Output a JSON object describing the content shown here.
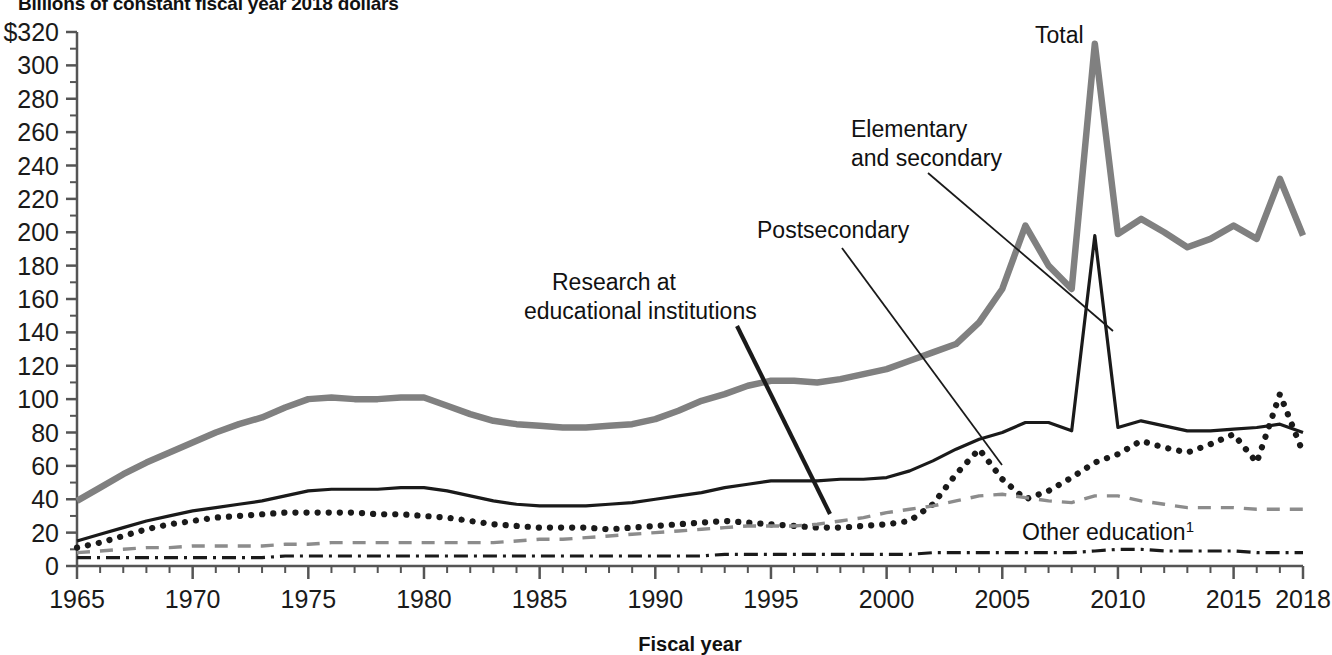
{
  "figure": {
    "title": "Billions of constant fiscal year 2018 dollars",
    "xlabel": "Fiscal year",
    "ylabel": ""
  },
  "annotations": {
    "total": "Total",
    "elementary_line1": "Elementary",
    "elementary_line2": "and secondary",
    "postsecondary": "Postsecondary",
    "research_line1": "Research at",
    "research_line2": "educational institutions",
    "other_education": "Other education",
    "other_education_footnote": "1"
  },
  "axes": {
    "y_ticks": [
      "$320",
      "300",
      "280",
      "260",
      "240",
      "220",
      "200",
      "180",
      "160",
      "140",
      "120",
      "100",
      "80",
      "60",
      "40",
      "20",
      "0"
    ],
    "y_tick_values": [
      320,
      300,
      280,
      260,
      240,
      220,
      200,
      180,
      160,
      140,
      120,
      100,
      80,
      60,
      40,
      20,
      0
    ],
    "x_ticks": [
      "1965",
      "1970",
      "1975",
      "1980",
      "1985",
      "1990",
      "1995",
      "2000",
      "2005",
      "2010",
      "2015",
      "2018"
    ],
    "x_tick_values": [
      1965,
      1970,
      1975,
      1980,
      1985,
      1990,
      1995,
      2000,
      2005,
      2010,
      2015,
      2018
    ]
  },
  "colors": {
    "total": "#808080",
    "elementary": "#1a1a1a",
    "postsecondary": "#1a1a1a",
    "research": "#8c8c8c",
    "other": "#1a1a1a",
    "axis": "#555555",
    "text": "#111111"
  },
  "chart_data": {
    "type": "line",
    "title": "Billions of constant fiscal year 2018 dollars",
    "xlabel": "Fiscal year",
    "ylabel": "Billions of constant fiscal year 2018 dollars",
    "xlim": [
      1965,
      2018
    ],
    "ylim": [
      0,
      320
    ],
    "grid": false,
    "legend": "annotated-inline",
    "x": [
      1965,
      1966,
      1967,
      1968,
      1969,
      1970,
      1971,
      1972,
      1973,
      1974,
      1975,
      1976,
      1977,
      1978,
      1979,
      1980,
      1981,
      1982,
      1983,
      1984,
      1985,
      1986,
      1987,
      1988,
      1989,
      1990,
      1991,
      1992,
      1993,
      1994,
      1995,
      1996,
      1997,
      1998,
      1999,
      2000,
      2001,
      2002,
      2003,
      2004,
      2005,
      2006,
      2007,
      2008,
      2009,
      2010,
      2011,
      2012,
      2013,
      2014,
      2015,
      2016,
      2017,
      2018
    ],
    "series": [
      {
        "name": "Total",
        "style": "solid-thick",
        "color": "#808080",
        "values": [
          39,
          47,
          55,
          62,
          68,
          74,
          80,
          85,
          89,
          95,
          100,
          101,
          100,
          100,
          101,
          101,
          96,
          91,
          87,
          85,
          84,
          83,
          83,
          84,
          85,
          88,
          93,
          99,
          103,
          108,
          111,
          111,
          110,
          112,
          115,
          118,
          123,
          128,
          133,
          146,
          166,
          204,
          180,
          166,
          313,
          199,
          208,
          200,
          191,
          196,
          204,
          196,
          232,
          198
        ]
      },
      {
        "name": "Elementary and secondary",
        "style": "solid-thin",
        "color": "#1a1a1a",
        "values": [
          15,
          19,
          23,
          27,
          30,
          33,
          35,
          37,
          39,
          42,
          45,
          46,
          46,
          46,
          47,
          47,
          45,
          42,
          39,
          37,
          36,
          36,
          36,
          37,
          38,
          40,
          42,
          44,
          47,
          49,
          51,
          51,
          51,
          52,
          52,
          53,
          57,
          63,
          70,
          76,
          80,
          86,
          86,
          81,
          198,
          83,
          87,
          84,
          81,
          81,
          82,
          83,
          85,
          80
        ]
      },
      {
        "name": "Postsecondary",
        "style": "dotted",
        "color": "#1a1a1a",
        "values": [
          11,
          14,
          18,
          22,
          25,
          27,
          29,
          30,
          31,
          32,
          32,
          32,
          32,
          31,
          31,
          30,
          29,
          27,
          25,
          24,
          23,
          23,
          23,
          22,
          23,
          24,
          25,
          26,
          27,
          26,
          25,
          24,
          23,
          23,
          24,
          25,
          27,
          37,
          55,
          70,
          52,
          40,
          45,
          53,
          62,
          67,
          75,
          71,
          68,
          73,
          79,
          62,
          103,
          68
        ]
      },
      {
        "name": "Research at educational institutions",
        "style": "dashed",
        "color": "#8c8c8c",
        "values": [
          8,
          9,
          10,
          11,
          11,
          12,
          12,
          12,
          12,
          13,
          13,
          14,
          14,
          14,
          14,
          14,
          14,
          14,
          14,
          15,
          16,
          16,
          17,
          18,
          19,
          20,
          21,
          22,
          23,
          24,
          24,
          24,
          25,
          27,
          29,
          32,
          34,
          36,
          39,
          42,
          43,
          41,
          39,
          38,
          42,
          42,
          39,
          37,
          35,
          35,
          35,
          34,
          34,
          34
        ]
      },
      {
        "name": "Other education",
        "style": "dash-dot",
        "color": "#1a1a1a",
        "values": [
          5,
          5,
          5,
          5,
          5,
          5,
          5,
          5,
          5,
          6,
          6,
          6,
          6,
          6,
          6,
          6,
          6,
          6,
          6,
          6,
          6,
          6,
          6,
          6,
          6,
          6,
          6,
          6,
          7,
          7,
          7,
          7,
          7,
          7,
          7,
          7,
          7,
          8,
          8,
          8,
          8,
          8,
          8,
          8,
          9,
          10,
          10,
          9,
          9,
          9,
          9,
          8,
          8,
          8
        ]
      }
    ]
  }
}
